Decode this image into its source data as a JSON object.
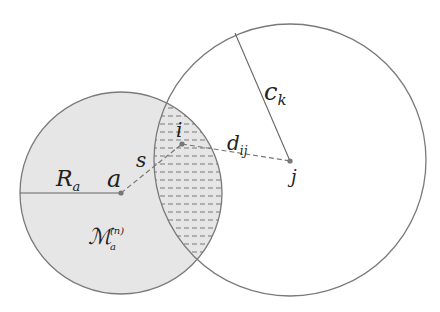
{
  "diagram": {
    "left_circle": {
      "cx": 121,
      "cy": 193,
      "r": 101,
      "fill": "#e6e6e6"
    },
    "right_circle": {
      "cx": 290,
      "cy": 160,
      "r": 136,
      "fill": "#ffffff"
    },
    "stroke_color": "#7a7a7a",
    "points": {
      "a": {
        "x": 121,
        "y": 193
      },
      "i": {
        "x": 182,
        "y": 144
      },
      "j": {
        "x": 290,
        "y": 161
      }
    },
    "labels": {
      "R": "R",
      "R_sub": "a",
      "a": "a",
      "s": "s",
      "i": "i",
      "d": "d",
      "d_sub": "ij",
      "c": "c",
      "c_sub": "k",
      "j": "j",
      "M": "ℳ",
      "M_sub": "a",
      "M_sup": "(n)"
    }
  }
}
